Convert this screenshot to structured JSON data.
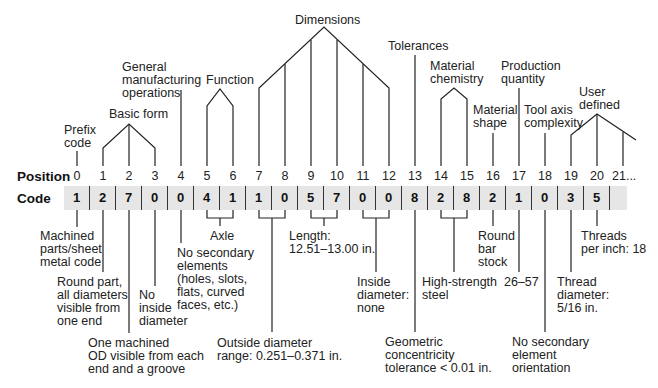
{
  "row_headers": {
    "position": "Position",
    "code": "Code"
  },
  "positions": [
    "0",
    "1",
    "2",
    "3",
    "4",
    "5",
    "6",
    "7",
    "8",
    "9",
    "10",
    "11",
    "12",
    "13",
    "14",
    "15",
    "16",
    "17",
    "18",
    "19",
    "20",
    "21..."
  ],
  "codes": [
    "1",
    "2",
    "7",
    "0",
    "0",
    "4",
    "1",
    "1",
    "0",
    "5",
    "7",
    "0",
    "0",
    "8",
    "2",
    "8",
    "2",
    "1",
    "0",
    "3",
    "5",
    ""
  ],
  "top_labels": {
    "prefix": "Prefix\ncode",
    "basic_form": "Basic form",
    "general_mfg": "General\nmanufacturing\noperations",
    "function": "Function",
    "dimensions": "Dimensions",
    "tolerances": "Tolerances",
    "material_chemistry": "Material\nchemistry",
    "material_shape": "Material\nshape",
    "production_quantity": "Production\nquantity",
    "tool_axis": "Tool axis\ncomplexity",
    "user_defined": "User\ndefined"
  },
  "bottom_labels": {
    "machined": "Machined\nparts/sheet\nmetal code",
    "round_part": "Round part,\nall diameters\nvisible from\none end",
    "one_machined": "One machined\nOD visible from each\nend and a groove",
    "no_inside": "No\ninside\ndiameter",
    "axle": "Axle",
    "no_secondary": "No secondary\nelements\n(holes, slots,\nflats, curved\nfaces, etc.)",
    "outside_diameter": "Outside diameter\nrange: 0.251–0.371 in.",
    "length": "Length:\n12.51–13.00 in.",
    "inside_diameter": "Inside\ndiameter:\nnone",
    "geometric": "Geometric\nconcentricity\ntolerance < 0.01 in.",
    "high_strength": "High-strength\nsteel",
    "round_bar": "Round\nbar\nstock",
    "quantity": "26–57",
    "no_secondary_orient": "No secondary\nelement\norientation",
    "thread_diameter": "Thread\ndiameter:\n5/16 in.",
    "threads_per_inch": "Threads\nper inch: 18"
  }
}
